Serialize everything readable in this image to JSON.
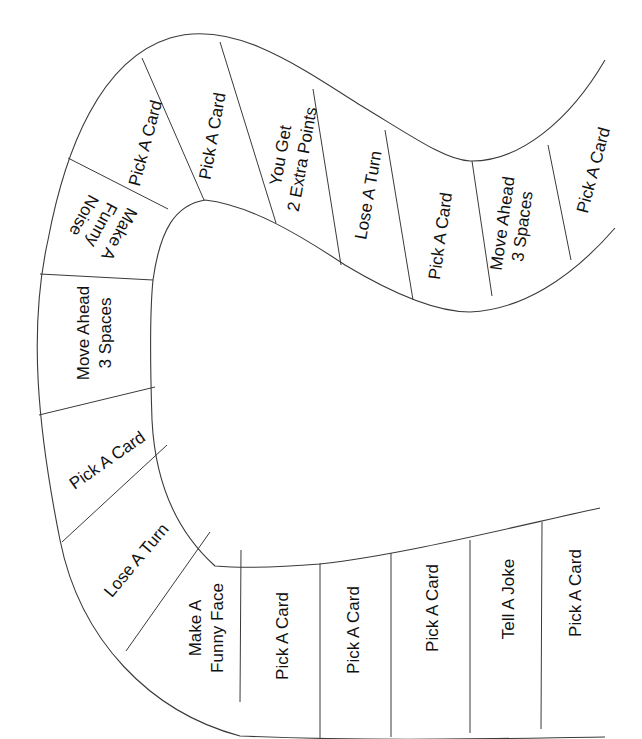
{
  "board": {
    "title": "",
    "colors": {
      "background": "#ffffff",
      "line": "#3a3a3a",
      "text": "#111111"
    },
    "spaces": [
      {
        "id": 1,
        "lines": [
          "Pick A Card"
        ]
      },
      {
        "id": 2,
        "lines": [
          "Tell A Joke"
        ]
      },
      {
        "id": 3,
        "lines": [
          "Pick A Card"
        ]
      },
      {
        "id": 4,
        "lines": [
          "Pick A Card"
        ]
      },
      {
        "id": 5,
        "lines": [
          "Pick A Card"
        ]
      },
      {
        "id": 6,
        "lines": [
          "Make A",
          "Funny Face"
        ]
      },
      {
        "id": 7,
        "lines": [
          "Lose A Turn"
        ]
      },
      {
        "id": 8,
        "lines": [
          "Pick A Card"
        ]
      },
      {
        "id": 9,
        "lines": [
          "Move Ahead",
          "3 Spaces"
        ]
      },
      {
        "id": 10,
        "lines": [
          "Make A",
          "Funny",
          "Noise"
        ]
      },
      {
        "id": 11,
        "lines": [
          "Pick A Card"
        ]
      },
      {
        "id": 12,
        "lines": [
          "Pick A Card"
        ]
      },
      {
        "id": 13,
        "lines": [
          "You Get",
          "2 Extra Points"
        ]
      },
      {
        "id": 14,
        "lines": [
          "Lose A Turn"
        ]
      },
      {
        "id": 15,
        "lines": [
          "Pick A Card"
        ]
      },
      {
        "id": 16,
        "lines": [
          "Move Ahead",
          "3 Spaces"
        ]
      },
      {
        "id": 17,
        "lines": [
          "Pick A Card"
        ]
      }
    ]
  }
}
